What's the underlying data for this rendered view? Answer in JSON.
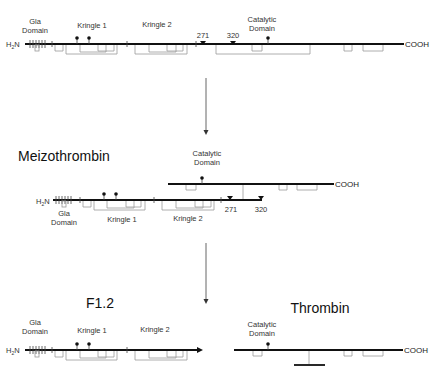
{
  "diagram": {
    "colors": {
      "chain": "#111111",
      "disulfide": "#999999",
      "text": "#333333",
      "arrow": "#555555"
    },
    "prothrombin": {
      "n_term": "H2N",
      "c_term": "COOH",
      "domains": [
        "Gla Domain",
        "Kringle 1",
        "Kringle 2",
        "Catalytic Domain"
      ],
      "gla_label_1": "Gla",
      "gla_label_2": "Domain",
      "kringle1": "Kringle 1",
      "kringle2": "Kringle 2",
      "catalytic_1": "Catalytic",
      "catalytic_2": "Domain",
      "cleavage_sites": [
        "271",
        "320"
      ]
    },
    "meizothrombin": {
      "title": "Meizothrombin",
      "n_term": "H2N",
      "c_term": "COOH",
      "gla_label_1": "Gla",
      "gla_label_2": "Domain",
      "kringle1": "Kringle 1",
      "kringle2": "Kringle 2",
      "catalytic_1": "Catalytic",
      "catalytic_2": "Domain",
      "cleavage_sites": [
        "271",
        "320"
      ]
    },
    "f12": {
      "title": "F1.2",
      "n_term": "H2N",
      "gla_label_1": "Gla",
      "gla_label_2": "Domain",
      "kringle1": "Kringle 1",
      "kringle2": "Kringle 2"
    },
    "thrombin": {
      "title": "Thrombin",
      "c_term": "COOH",
      "catalytic_1": "Catalytic",
      "catalytic_2": "Domain"
    }
  }
}
